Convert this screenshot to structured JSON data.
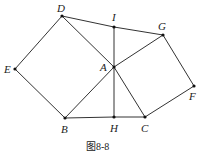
{
  "caption": "图8-8",
  "points": {
    "D": {
      "label": "D",
      "x": 62,
      "y": 16
    },
    "I": {
      "label": "I",
      "x": 114,
      "y": 27
    },
    "G": {
      "label": "G",
      "x": 163,
      "y": 35
    },
    "E": {
      "label": "E",
      "x": 15,
      "y": 69
    },
    "A": {
      "label": "A",
      "x": 114,
      "y": 67
    },
    "F": {
      "label": "F",
      "x": 194,
      "y": 86
    },
    "B": {
      "label": "B",
      "x": 65,
      "y": 118
    },
    "H": {
      "label": "H",
      "x": 114,
      "y": 117
    },
    "C": {
      "label": "C",
      "x": 145,
      "y": 117
    }
  },
  "segments": [
    [
      "D",
      "I"
    ],
    [
      "I",
      "G"
    ],
    [
      "D",
      "E"
    ],
    [
      "E",
      "B"
    ],
    [
      "D",
      "A"
    ],
    [
      "A",
      "C"
    ],
    [
      "B",
      "A"
    ],
    [
      "A",
      "G"
    ],
    [
      "G",
      "F"
    ],
    [
      "F",
      "C"
    ],
    [
      "B",
      "H"
    ],
    [
      "H",
      "C"
    ],
    [
      "I",
      "H"
    ]
  ]
}
